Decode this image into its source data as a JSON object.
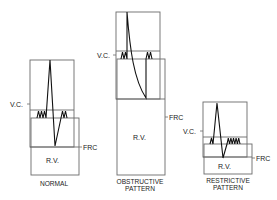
{
  "figure": {
    "type": "lung-volume-spirogram-comparison",
    "colors": {
      "line": "#111111",
      "box": "#6a6a6a",
      "text": "#222222",
      "background": "#ffffff"
    },
    "panels": [
      {
        "id": "normal",
        "caption": [
          "NORMAL"
        ],
        "vc_label": "V.C.",
        "frc_label": "FRC",
        "rv_label": "R.V."
      },
      {
        "id": "obstructive",
        "caption": [
          "OBSTRUCTIVE",
          "PATTERN"
        ],
        "vc_label": "V.C.",
        "frc_label": "FRC",
        "rv_label": "R.V."
      },
      {
        "id": "restrictive",
        "caption": [
          "RESTRICTIVE",
          "PATTERN"
        ],
        "vc_label": "V.C.",
        "frc_label": "FRC",
        "rv_label": "R.V."
      }
    ]
  }
}
